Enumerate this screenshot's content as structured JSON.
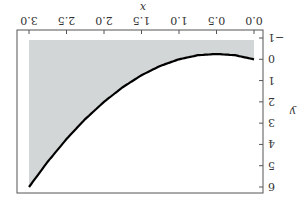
{
  "chart_data": {
    "type": "line",
    "title": "",
    "xlabel": "x",
    "ylabel": "y",
    "xlim": [
      0,
      3
    ],
    "ylim": [
      -1,
      6
    ],
    "x_ticks": [
      "0.0",
      "0.5",
      "1.0",
      "1.5",
      "2.0",
      "2.5",
      "3.0"
    ],
    "y_ticks": [
      "-1",
      "0",
      "1",
      "2",
      "3",
      "4",
      "5",
      "6"
    ],
    "grid": false,
    "legend": null,
    "rotation_deg": 180,
    "series": [
      {
        "name": "y = x^2 - x",
        "x": [
          0,
          0.25,
          0.5,
          0.75,
          1.0,
          1.25,
          1.5,
          1.75,
          2.0,
          2.25,
          2.5,
          2.75,
          3.0
        ],
        "y": [
          0,
          -0.19,
          -0.25,
          -0.19,
          0,
          0.31,
          0.75,
          1.31,
          2.0,
          2.81,
          3.75,
          4.81,
          6.0
        ],
        "color": "#000000"
      }
    ],
    "shaded_region": {
      "description": "area between y = -0.9 and the curve",
      "lower": -0.9,
      "upper": "curve",
      "color": "#d3d6d6"
    }
  }
}
